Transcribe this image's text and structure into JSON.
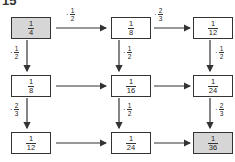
{
  "title": "15",
  "grid": [
    [
      {
        "num": "1",
        "den": "4",
        "shaded": true
      },
      {
        "num": "1",
        "den": "8"
      },
      {
        "num": "1",
        "den": "12"
      }
    ],
    [
      {
        "num": "1",
        "den": "8"
      },
      {
        "num": "1",
        "den": "16"
      },
      {
        "num": "1",
        "den": "24"
      }
    ],
    [
      {
        "num": "1",
        "den": "12"
      },
      {
        "num": "1",
        "den": "24"
      },
      {
        "num": "1",
        "den": "36",
        "shaded": true
      }
    ]
  ],
  "horizontal_labels": {
    "r0c0": {
      "op": "·",
      "num": "1",
      "den": "2"
    },
    "r0c1": {
      "op": "·",
      "num": "2",
      "den": "3"
    }
  },
  "vertical_labels": {
    "r0c0": {
      "op": "·",
      "num": "1",
      "den": "2"
    },
    "r0c1": {
      "op": "·",
      "num": "1",
      "den": "2"
    },
    "r0c2": {
      "op": "·",
      "num": "1",
      "den": "2"
    },
    "r1c0": {
      "op": "·",
      "num": "2",
      "den": "3"
    },
    "r1c1": {
      "op": "·",
      "num": "1",
      "den": "2"
    },
    "r1c2": {
      "op": "·",
      "num": "2",
      "den": "3"
    }
  },
  "colors": {
    "shaded": "#d6d6d6",
    "line": "#333333"
  }
}
